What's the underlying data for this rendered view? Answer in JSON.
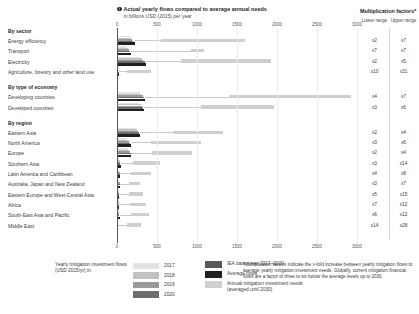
{
  "header": {
    "marker": "i",
    "title": "Actual yearly flows compared to average annual needs",
    "subtitle": "in billions USD (2015) per year"
  },
  "multiplication": {
    "title": "Multiplication factors*",
    "lower_label": "Lower range",
    "upper_label": "Upper range"
  },
  "legend": {
    "caption": "Yearly mitigation investment flows (USD 2015/yr) in:",
    "years": [
      {
        "label": "2017",
        "color": "#e3e3e3"
      },
      {
        "label": "2018",
        "color": "#c2c2c2"
      },
      {
        "label": "2019",
        "color": "#9a9a9a"
      },
      {
        "label": "2020",
        "color": "#6d6d6d"
      }
    ],
    "items": [
      {
        "label": "IEA data mean 2017–2020",
        "color": "#58585a"
      },
      {
        "label": "Average flows",
        "color": "#231f20"
      },
      {
        "label": "Annual mitigation investment needs (averaged until 2030)",
        "color": "#cfcfcf"
      }
    ]
  },
  "footnote": "*Multiplication factors indicate the x-fold increase between yearly mitigation flows to average yearly mitigation investment needs. Globally, current mitigation financial flows are a factor of three to six below the average levels up to 2030.",
  "chart_data": {
    "type": "bar",
    "title": "Actual yearly flows compared to average annual needs",
    "subtitle": "in billions USD (2015) per year",
    "xlabel": "billions USD (2015) per year",
    "ylabel": "",
    "xlim": [
      0,
      3000
    ],
    "xticks": [
      0,
      500,
      1000,
      1500,
      2000,
      2500,
      3000
    ],
    "ticklabels": [
      "0",
      "500",
      "1000",
      "1500",
      "2000",
      "2500",
      "3000"
    ],
    "grid": true,
    "legend_position": "bottom",
    "groups": [
      {
        "group": "By sector",
        "rows": [
          {
            "label": "Energy efficiency",
            "flows": [
              170,
              180,
              190,
              200
            ],
            "mean": 230,
            "needs_start": 550,
            "needs_end": 1600,
            "lower": "x2",
            "upper": "x7"
          },
          {
            "label": "Transport",
            "flows": [
              130,
              140,
              150,
              160
            ],
            "mean": 175,
            "needs_start": 920,
            "needs_end": 1090,
            "lower": "x7",
            "upper": "x7"
          },
          {
            "label": "Electricity",
            "flows": [
              290,
              310,
              330,
              350
            ],
            "mean": 360,
            "needs_start": 800,
            "needs_end": 1930,
            "lower": "x2",
            "upper": "x5"
          },
          {
            "label": "Agriculture, forestry and other land use",
            "flows": [
              15,
              18,
              20,
              22
            ],
            "mean": 25,
            "needs_start": 120,
            "needs_end": 420,
            "lower": "x10",
            "upper": "x31"
          }
        ]
      },
      {
        "group": "By type of economy",
        "rows": [
          {
            "label": "Developing countries",
            "flows": [
              290,
              305,
              320,
              340
            ],
            "mean": 350,
            "needs_start": 1400,
            "needs_end": 2920,
            "lower": "x4",
            "upper": "x7"
          },
          {
            "label": "Developed countries",
            "flows": [
              280,
              300,
              315,
              330
            ],
            "mean": 340,
            "needs_start": 1050,
            "needs_end": 1960,
            "lower": "x3",
            "upper": "x6"
          }
        ]
      },
      {
        "group": "By region",
        "rows": [
          {
            "label": "Eastern Asia",
            "flows": [
              230,
              250,
              265,
              280
            ],
            "mean": 290,
            "needs_start": 700,
            "needs_end": 1320,
            "lower": "x2",
            "upper": "x4"
          },
          {
            "label": "North America",
            "flows": [
              130,
              145,
              155,
              165
            ],
            "mean": 170,
            "needs_start": 420,
            "needs_end": 1050,
            "lower": "x3",
            "upper": "x6"
          },
          {
            "label": "Europe",
            "flows": [
              140,
              155,
              165,
              175
            ],
            "mean": 180,
            "needs_start": 440,
            "needs_end": 940,
            "lower": "x2",
            "upper": "x4"
          },
          {
            "label": "Southern Asia",
            "flows": [
              30,
              34,
              38,
              42
            ],
            "mean": 45,
            "needs_start": 200,
            "needs_end": 540,
            "lower": "x3",
            "upper": "x14"
          },
          {
            "label": "Latin America and Caribbean",
            "flows": [
              28,
              31,
              34,
              38
            ],
            "mean": 40,
            "needs_start": 180,
            "needs_end": 430,
            "lower": "x4",
            "upper": "x8"
          },
          {
            "label": "Australia, Japan and New Zealand",
            "flows": [
              26,
              29,
              32,
              35
            ],
            "mean": 37,
            "needs_start": 155,
            "needs_end": 290,
            "lower": "x3",
            "upper": "x7"
          },
          {
            "label": "Eastern Europe and West-Central Asia",
            "flows": [
              18,
              20,
              22,
              24
            ],
            "mean": 25,
            "needs_start": 150,
            "needs_end": 330,
            "lower": "x5",
            "upper": "x15"
          },
          {
            "label": "Africa",
            "flows": [
              20,
              22,
              25,
              28
            ],
            "mean": 30,
            "needs_start": 160,
            "needs_end": 360,
            "lower": "x7",
            "upper": "x12"
          },
          {
            "label": "South-East Asia and Pacific",
            "flows": [
              22,
              25,
              28,
              30
            ],
            "mean": 32,
            "needs_start": 175,
            "needs_end": 400,
            "lower": "x6",
            "upper": "x12"
          },
          {
            "label": "Middle East",
            "flows": [
              10,
              12,
              14,
              16
            ],
            "mean": 17,
            "needs_start": 130,
            "needs_end": 300,
            "lower": "x14",
            "upper": "x28"
          }
        ]
      }
    ]
  }
}
